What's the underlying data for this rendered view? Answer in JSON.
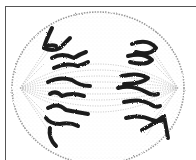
{
  "figure": {
    "colors": {
      "background": "#ffffff",
      "frame": "#555555",
      "cell_outline": "#9a9a9a",
      "spindle_fibers": "#b5b5b5",
      "chromosomes": "#1e1e1e"
    }
  }
}
